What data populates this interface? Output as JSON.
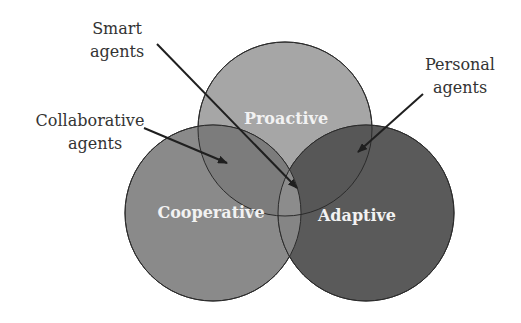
{
  "diagram": {
    "type": "venn",
    "circles": [
      {
        "id": "proactive",
        "label": "Proactive",
        "cx": 285,
        "cy": 129,
        "r": 87,
        "fill": "#a6a6a6"
      },
      {
        "id": "cooperative",
        "label": "Cooperative",
        "cx": 213,
        "cy": 213,
        "r": 88,
        "fill": "#8a8a8a"
      },
      {
        "id": "adaptive",
        "label": "Adaptive",
        "cx": 366,
        "cy": 213,
        "r": 88,
        "fill": "#5a5a5a"
      }
    ],
    "callouts": [
      {
        "id": "smart",
        "lines": [
          "Smart",
          "agents"
        ]
      },
      {
        "id": "collaborative",
        "lines": [
          "Collaborative",
          "agents"
        ]
      },
      {
        "id": "personal",
        "lines": [
          "Personal",
          "agents"
        ]
      }
    ],
    "colors": {
      "text": "#333333",
      "inner_text": "#f2f2f2",
      "outline": "#2b2b2b",
      "arrow": "#1f1f1f"
    }
  }
}
